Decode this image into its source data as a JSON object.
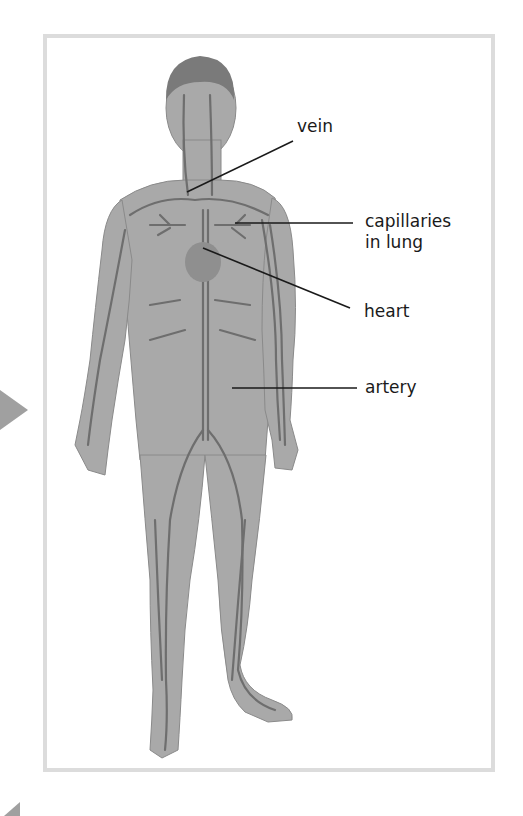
{
  "diagram": {
    "labels": [
      {
        "id": "vein",
        "text": "vein",
        "x": 297,
        "y": 116
      },
      {
        "id": "capillaries",
        "text": "capillaries",
        "text2": "in lung",
        "x": 365,
        "y": 211
      },
      {
        "id": "heart",
        "text": "heart",
        "x": 364,
        "y": 301
      },
      {
        "id": "artery",
        "text": "artery",
        "x": 365,
        "y": 377
      }
    ],
    "leaders": [
      {
        "id": "vein",
        "x1": 187,
        "y1": 192,
        "x2": 293,
        "y2": 141
      },
      {
        "id": "capillaries",
        "x1": 235,
        "y1": 223,
        "x2": 353,
        "y2": 223
      },
      {
        "id": "heart",
        "x1": 203,
        "y1": 248,
        "x2": 350,
        "y2": 308
      },
      {
        "id": "artery",
        "x1": 232,
        "y1": 388,
        "x2": 357,
        "y2": 388
      }
    ],
    "colors": {
      "frame": "#dcdcdc",
      "body": "#a9a9a9",
      "vessel": "#6e6e6e",
      "hair": "#7a7a7a",
      "text": "#1a1a1a",
      "arrow": "#a0a0a0"
    }
  }
}
